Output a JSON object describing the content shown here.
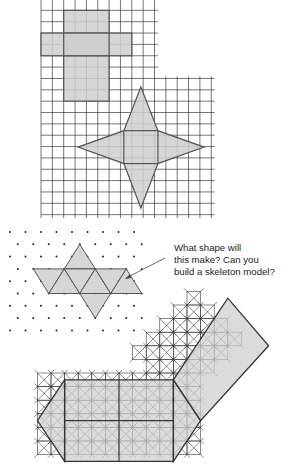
{
  "figure": {
    "colors": {
      "grid_line": "#3a3a3a",
      "shape_fill": "#cfcfcf",
      "shape_stroke": "#555555",
      "dot": "#222222"
    },
    "panels": [
      {
        "id": "cross-net",
        "description": "Cube net (cross) on square grid"
      },
      {
        "id": "star-net",
        "description": "Square pyramid net (star) on square grid"
      },
      {
        "id": "triangle-net",
        "description": "Triangle net on isometric dot grid"
      },
      {
        "id": "diagonal-net",
        "description": "Prism net on diagonal square grid"
      }
    ]
  },
  "callout": {
    "lines": [
      "What shape will",
      "this make? Can you",
      "build a skeleton model?"
    ]
  }
}
